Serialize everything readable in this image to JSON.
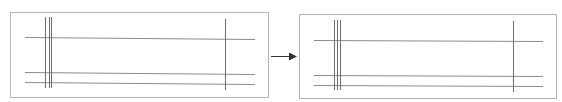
{
  "diagram": {
    "type": "before-after transformation",
    "colors": {
      "panel_border": "#b4b4b4",
      "h_line": "#8c8c8c",
      "v_line": "#6e6e6e",
      "arrow": "#333333"
    },
    "panels": [
      {
        "name": "before-panel",
        "rect": [
          10,
          12,
          258,
          85
        ],
        "h_lines": [
          [
            25,
            37,
            255,
            39
          ],
          [
            25,
            72,
            255,
            74
          ],
          [
            25,
            82,
            255,
            84
          ]
        ],
        "v_lines": [
          [
            45,
            17,
            45,
            88
          ],
          [
            49,
            17,
            49,
            88
          ],
          [
            51,
            17,
            51,
            88
          ],
          [
            225,
            19,
            225,
            90
          ]
        ]
      },
      {
        "name": "after-panel",
        "rect": [
          299,
          14,
          257,
          84
        ],
        "h_lines": [
          [
            314,
            40,
            543,
            41
          ],
          [
            314,
            75,
            543,
            76
          ],
          [
            314,
            85,
            543,
            86
          ]
        ],
        "v_lines": [
          [
            334,
            20,
            334,
            90
          ],
          [
            337,
            20,
            337,
            90
          ],
          [
            340,
            20,
            340,
            90
          ],
          [
            513,
            21,
            513,
            92
          ]
        ]
      }
    ],
    "arrow": {
      "from": [
        271,
        56
      ],
      "to": [
        296,
        56
      ]
    }
  }
}
